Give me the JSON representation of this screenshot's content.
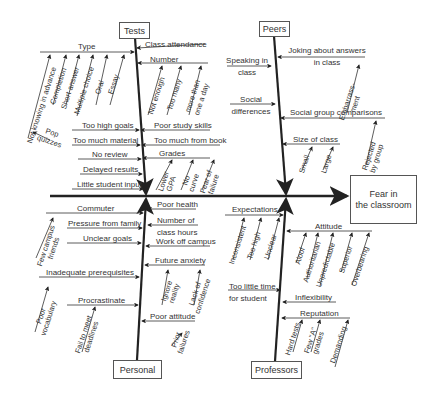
{
  "effect": {
    "line1": "Fear in",
    "line2": "the classroom"
  },
  "categories": {
    "tests": "Tests",
    "peers": "Peers",
    "personal": "Personal",
    "professors": "Professors"
  },
  "tests": {
    "type": {
      "label": "Type",
      "subs": [
        "Not knowing in advance",
        "Completion",
        "Short answer",
        "Multiple choice",
        "Oral",
        "Essay"
      ]
    },
    "pop_quizzes": {
      "line1": "Pop",
      "line2": "quizzes"
    },
    "class_attendance": "Class attendance",
    "number": {
      "label": "Number",
      "subs": [
        "Not enough",
        "Too many",
        "more than",
        "one a day"
      ]
    },
    "too_high_goals": "Too high goals",
    "too_much_material": "Too much material",
    "no_review": "No review",
    "delayed_results": "Delayed results",
    "little_student_input": "Little student input",
    "poor_study_skills": "Poor study skills",
    "too_much_from_book": "Too much from book",
    "grades": {
      "label": "Grades",
      "subs": [
        [
          "Lower",
          "GPA"
        ],
        [
          "No",
          "curve"
        ],
        [
          "Fear of",
          "failure"
        ]
      ]
    }
  },
  "peers": {
    "speaking": {
      "line1": "Speaking in",
      "line2": "class"
    },
    "social_differences": {
      "line1": "Social",
      "line2": "differences"
    },
    "joking": {
      "line1": "Joking about answers",
      "line2": "in class"
    },
    "embarrassment": {
      "line1": "Embarrass-",
      "line2": "ment"
    },
    "social_group_comparisons": "Social group comparisons",
    "rejected": {
      "line1": "Rejected",
      "line2": "by group"
    },
    "size_of_class": {
      "label": "Size of class",
      "subs": [
        "Small",
        "Large"
      ]
    }
  },
  "personal": {
    "commuter": "Commuter",
    "few_campus_friends": {
      "line1": "Few campus",
      "line2": "friends"
    },
    "pressure_from_family": "Pressure from family",
    "unclear_goals": "Unclear goals",
    "inadequate_prerequisites": "Inadequate prerequisites",
    "poor_vocabulary": {
      "line1": "Poor",
      "line2": "vocabulary"
    },
    "procrastinate": "Procrastinate",
    "fail_deadlines": {
      "line1": "Fail to meet",
      "line2": "deadlines"
    },
    "poor_health": "Poor health",
    "number_of_class_hours": {
      "line1": "Number of",
      "line2": "class hours"
    },
    "work_off_campus": "Work off campus",
    "future_anxiety": "Future anxiety",
    "ignore_reality": {
      "line1": "Ignore",
      "line2": "reality"
    },
    "lack_of_confidence": {
      "line1": "Lack of",
      "line2": "confidence"
    },
    "poor_attitude": "Poor attitude",
    "prior_failures": {
      "line1": "Prior",
      "line2": "failures"
    }
  },
  "professors": {
    "expectations": {
      "label": "Expectations",
      "subs": [
        "Inconsistent",
        "Too high",
        "Unclear"
      ]
    },
    "too_little_time": {
      "line1": "Too little time",
      "line2": "for student"
    },
    "attitude": {
      "label": "Attitude",
      "subs": [
        "Aloof",
        "Authoritarian",
        "Unpredictable",
        "Superior",
        "Overbearing"
      ]
    },
    "inflexibility": "Inflexibility",
    "reputation": {
      "label": "Reputation",
      "subs": [
        [
          "Hard tests"
        ],
        [
          "Few \"A\"",
          "grades"
        ],
        [
          "Demanding"
        ]
      ]
    }
  },
  "colors": {
    "line": "#222222",
    "text": "#333333",
    "box_border": "#555555"
  }
}
